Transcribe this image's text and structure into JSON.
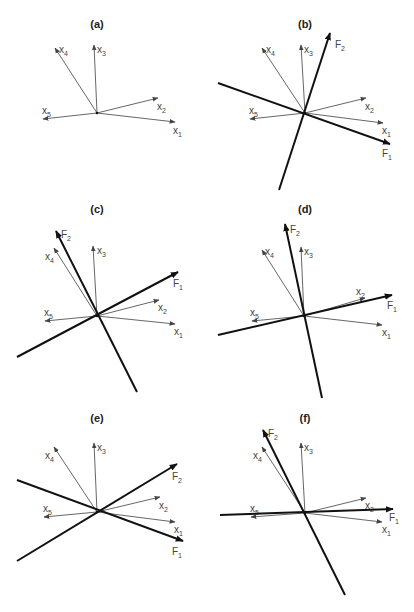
{
  "figure": {
    "colors": {
      "variable_vector": "#555555",
      "factor_axis": "#111111",
      "label": "#444444",
      "background": "#ffffff"
    }
  },
  "panels": [
    {
      "id": "a",
      "label": "(a)",
      "label_pos": [
        97,
        28
      ],
      "origin": [
        97,
        113
      ],
      "variables": [
        {
          "name": "x",
          "sub": "1",
          "tip": [
            175,
            122
          ],
          "label_pos": [
            173,
            134
          ]
        },
        {
          "name": "x",
          "sub": "2",
          "tip": [
            158,
            98
          ],
          "label_pos": [
            157,
            110
          ]
        },
        {
          "name": "x",
          "sub": "3",
          "tip": [
            94,
            45
          ],
          "label_pos": [
            97,
            53
          ]
        },
        {
          "name": "x",
          "sub": "4",
          "tip": [
            55,
            48
          ],
          "label_pos": [
            59,
            53
          ]
        },
        {
          "name": "x",
          "sub": "5",
          "tip": [
            43,
            119
          ],
          "label_pos": [
            42,
            114
          ]
        }
      ],
      "factors": []
    },
    {
      "id": "b",
      "label": "(b)",
      "label_pos": [
        305,
        28
      ],
      "origin": [
        305,
        113
      ],
      "variables": [
        {
          "name": "x",
          "sub": "1",
          "tip": [
            383,
            123
          ],
          "label_pos": [
            382,
            134
          ]
        },
        {
          "name": "x",
          "sub": "2",
          "tip": [
            366,
            98
          ],
          "label_pos": [
            365,
            110
          ]
        },
        {
          "name": "x",
          "sub": "3",
          "tip": [
            301,
            45
          ],
          "label_pos": [
            304,
            53
          ]
        },
        {
          "name": "x",
          "sub": "4",
          "tip": [
            262,
            48
          ],
          "label_pos": [
            266,
            53
          ]
        },
        {
          "name": "x",
          "sub": "5",
          "tip": [
            250,
            119
          ],
          "label_pos": [
            249,
            114
          ]
        }
      ],
      "factors": [
        {
          "name": "F",
          "sub": "1",
          "tail": [
            218,
            83
          ],
          "tip": [
            390,
            144
          ],
          "label_pos": [
            382,
            157
          ]
        },
        {
          "name": "F",
          "sub": "2",
          "tail": [
            279,
            190
          ],
          "tip": [
            330,
            33
          ],
          "label_pos": [
            335,
            48
          ]
        }
      ]
    },
    {
      "id": "c",
      "label": "(c)",
      "label_pos": [
        97,
        213
      ],
      "origin": [
        97,
        316
      ],
      "variables": [
        {
          "name": "x",
          "sub": "1",
          "tip": [
            175,
            324
          ],
          "label_pos": [
            174,
            335
          ]
        },
        {
          "name": "x",
          "sub": "2",
          "tip": [
            159,
            300
          ],
          "label_pos": [
            158,
            311
          ]
        },
        {
          "name": "x",
          "sub": "3",
          "tip": [
            93,
            246
          ],
          "label_pos": [
            97,
            254
          ]
        },
        {
          "name": "x",
          "sub": "4",
          "tip": [
            54,
            248
          ],
          "label_pos": [
            45,
            260
          ]
        },
        {
          "name": "x",
          "sub": "5",
          "tip": [
            45,
            321
          ],
          "label_pos": [
            44,
            316
          ]
        }
      ],
      "factors": [
        {
          "name": "F",
          "sub": "1",
          "tail": [
            17,
            357
          ],
          "tip": [
            178,
            272
          ],
          "label_pos": [
            173,
            287
          ]
        },
        {
          "name": "F",
          "sub": "2",
          "tail": [
            137,
            392
          ],
          "tip": [
            56,
            231
          ],
          "label_pos": [
            61,
            238
          ]
        }
      ]
    },
    {
      "id": "d",
      "label": "(d)",
      "label_pos": [
        305,
        213
      ],
      "origin": [
        304,
        316
      ],
      "variables": [
        {
          "name": "x",
          "sub": "1",
          "tip": [
            382,
            325
          ],
          "label_pos": [
            382,
            336
          ]
        },
        {
          "name": "x",
          "sub": "2",
          "tip": [
            365,
            298
          ],
          "label_pos": [
            356,
            295
          ]
        },
        {
          "name": "x",
          "sub": "3",
          "tip": [
            301,
            247
          ],
          "label_pos": [
            304,
            255
          ]
        },
        {
          "name": "x",
          "sub": "4",
          "tip": [
            262,
            250
          ],
          "label_pos": [
            265,
            255
          ]
        },
        {
          "name": "x",
          "sub": "5",
          "tip": [
            252,
            321
          ],
          "label_pos": [
            250,
            316
          ]
        }
      ],
      "factors": [
        {
          "name": "F",
          "sub": "1",
          "tail": [
            218,
            335
          ],
          "tip": [
            392,
            295
          ],
          "label_pos": [
            387,
            309
          ]
        },
        {
          "name": "F",
          "sub": "2",
          "tail": [
            322,
            398
          ],
          "tip": [
            285,
            224
          ],
          "label_pos": [
            290,
            233
          ]
        }
      ]
    },
    {
      "id": "e",
      "label": "(e)",
      "label_pos": [
        97,
        422
      ],
      "origin": [
        97,
        512
      ],
      "variables": [
        {
          "name": "x",
          "sub": "1",
          "tip": [
            175,
            522
          ],
          "label_pos": [
            174,
            533
          ]
        },
        {
          "name": "x",
          "sub": "2",
          "tip": [
            160,
            497
          ],
          "label_pos": [
            159,
            509
          ]
        },
        {
          "name": "x",
          "sub": "3",
          "tip": [
            94,
            443
          ],
          "label_pos": [
            97,
            451
          ]
        },
        {
          "name": "x",
          "sub": "4",
          "tip": [
            54,
            447
          ],
          "label_pos": [
            45,
            459
          ]
        },
        {
          "name": "x",
          "sub": "5",
          "tip": [
            44,
            517
          ],
          "label_pos": [
            43,
            512
          ]
        }
      ],
      "factors": [
        {
          "name": "F",
          "sub": "1",
          "tail": [
            17,
            480
          ],
          "tip": [
            183,
            541
          ],
          "label_pos": [
            172,
            555
          ]
        },
        {
          "name": "F",
          "sub": "2",
          "tail": [
            17,
            561
          ],
          "tip": [
            177,
            464
          ],
          "label_pos": [
            172,
            480
          ]
        }
      ]
    },
    {
      "id": "f",
      "label": "(f)",
      "label_pos": [
        305,
        422
      ],
      "origin": [
        305,
        513
      ],
      "variables": [
        {
          "name": "x",
          "sub": "1",
          "tip": [
            382,
            522
          ],
          "label_pos": [
            382,
            533
          ]
        },
        {
          "name": "x",
          "sub": "2",
          "tip": [
            366,
            498
          ],
          "label_pos": [
            365,
            509
          ]
        },
        {
          "name": "x",
          "sub": "3",
          "tip": [
            301,
            443
          ],
          "label_pos": [
            304,
            451
          ]
        },
        {
          "name": "x",
          "sub": "4",
          "tip": [
            262,
            447
          ],
          "label_pos": [
            253,
            459
          ]
        },
        {
          "name": "x",
          "sub": "5",
          "tip": [
            251,
            517
          ],
          "label_pos": [
            250,
            512
          ]
        }
      ],
      "factors": [
        {
          "name": "F",
          "sub": "1",
          "tail": [
            220,
            515
          ],
          "tip": [
            393,
            509
          ],
          "label_pos": [
            389,
            521
          ]
        },
        {
          "name": "F",
          "sub": "2",
          "tail": [
            345,
            595
          ],
          "tip": [
            263,
            430
          ],
          "label_pos": [
            268,
            437
          ]
        }
      ]
    }
  ]
}
